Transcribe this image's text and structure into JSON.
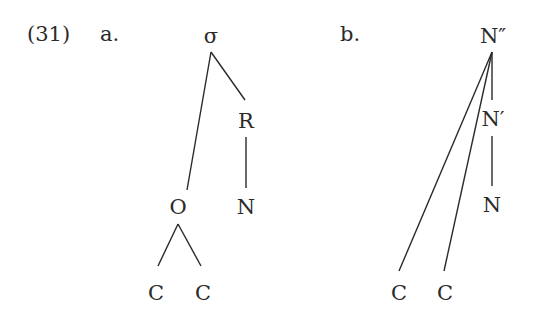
{
  "example": {
    "number": "(31)",
    "a_label": "a.",
    "b_label": "b."
  },
  "tree_a": {
    "root": "σ",
    "rhyme": "R",
    "onset": "O",
    "nucleus": "N",
    "onset_children": [
      "C",
      "C"
    ]
  },
  "tree_b": {
    "root": "N″",
    "bar": "N′",
    "head": "N",
    "children": [
      "C",
      "C"
    ]
  },
  "colors": {
    "ink": "#2a2a2a",
    "background": "#ffffff"
  }
}
